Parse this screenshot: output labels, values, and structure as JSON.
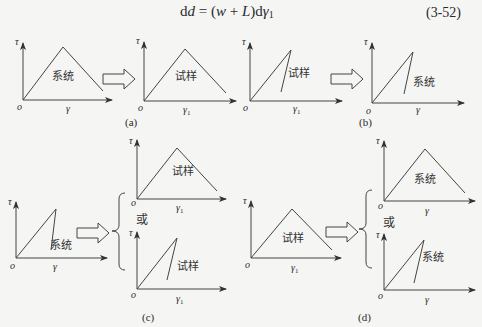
{
  "equation": {
    "text": "dd = (w + L)dγ1",
    "lhs": "d",
    "lhs_var": "d",
    "eq": " = (",
    "w": "w",
    "plus": " + ",
    "L": "L",
    "close": ")d",
    "gamma": "γ",
    "sub": "1",
    "number": "(3-52)"
  },
  "labels": {
    "tau": "τ",
    "origin": "o",
    "gamma": "γ",
    "gamma1_sub": "1",
    "system": "系统",
    "specimen": "试样",
    "or": "或"
  },
  "panels": [
    {
      "id": "a",
      "caption": "(a)",
      "from": {
        "shape": "triangle",
        "label": "系统",
        "xaxis": "γ"
      },
      "to": [
        {
          "shape": "triangle",
          "label": "试样",
          "xaxis": "γ1"
        }
      ]
    },
    {
      "id": "b",
      "caption": "(b)",
      "from": {
        "shape": "sharp-drop",
        "label": "试样",
        "xaxis": "γ1"
      },
      "to": [
        {
          "shape": "sharp-drop",
          "label": "系统",
          "xaxis": "γ"
        }
      ]
    },
    {
      "id": "c",
      "caption": "(c)",
      "from": {
        "shape": "sharp-drop",
        "label": "系统",
        "xaxis": "γ"
      },
      "to": [
        {
          "shape": "triangle",
          "label": "试样",
          "xaxis": "γ1"
        },
        {
          "shape": "sharp-drop",
          "label": "试样",
          "xaxis": "γ1"
        }
      ]
    },
    {
      "id": "d",
      "caption": "(d)",
      "from": {
        "shape": "triangle",
        "label": "试样",
        "xaxis": "γ1"
      },
      "to": [
        {
          "shape": "triangle",
          "label": "系统",
          "xaxis": "γ"
        },
        {
          "shape": "sharp-drop",
          "label": "系统",
          "xaxis": "γ"
        }
      ]
    }
  ]
}
